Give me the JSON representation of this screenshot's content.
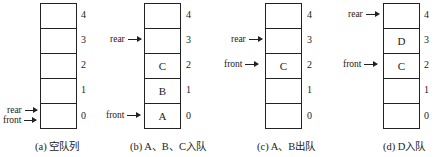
{
  "panels": [
    {
      "caption": "(a) 空队列",
      "cells": [
        "",
        "",
        "",
        "",
        ""
      ],
      "indices": [
        "4",
        "3",
        "2",
        "1",
        "0"
      ],
      "pointers": [
        {
          "label": "rear",
          "points_to_index": 0
        },
        {
          "label": "front",
          "points_to_index": 0
        }
      ]
    },
    {
      "caption": "(b) A、B、C入队",
      "cells": [
        "",
        "",
        "C",
        "B",
        "A"
      ],
      "indices": [
        "4",
        "3",
        "2",
        "1",
        "0"
      ],
      "pointers": [
        {
          "label": "rear",
          "points_to_index": 3
        },
        {
          "label": "front",
          "points_to_index": 0
        }
      ]
    },
    {
      "caption": "(c) A、B出队",
      "cells": [
        "",
        "",
        "C",
        "",
        ""
      ],
      "indices": [
        "4",
        "3",
        "2",
        "1",
        "0"
      ],
      "pointers": [
        {
          "label": "rear",
          "points_to_index": 3
        },
        {
          "label": "front",
          "points_to_index": 2
        }
      ]
    },
    {
      "caption": "(d) D入队",
      "cells": [
        "",
        "D",
        "C",
        "",
        ""
      ],
      "indices": [
        "4",
        "3",
        "2",
        "1",
        "0"
      ],
      "pointers": [
        {
          "label": "rear",
          "points_to_index": 4
        },
        {
          "label": "front",
          "points_to_index": 2
        }
      ]
    }
  ]
}
